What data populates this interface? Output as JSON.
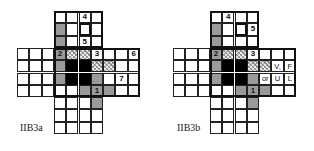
{
  "figures": [
    {
      "id": "a",
      "label": "IIB3a",
      "origin_x": 17,
      "label_pos": [
        20,
        122
      ],
      "cells": [
        {
          "r": 0,
          "c": 5,
          "text": "4"
        },
        {
          "r": 1,
          "c": 3,
          "fill": "grey"
        },
        {
          "r": 1,
          "c": 5,
          "fill": "bold"
        },
        {
          "r": 2,
          "c": 3,
          "fill": "grey"
        },
        {
          "r": 2,
          "c": 5,
          "text": "5"
        },
        {
          "r": 3,
          "c": 3,
          "fill": "grey",
          "text": "2"
        },
        {
          "r": 3,
          "c": 4,
          "fill": "hatch"
        },
        {
          "r": 3,
          "c": 5,
          "fill": "hatch"
        },
        {
          "r": 3,
          "c": 6,
          "text": "3"
        },
        {
          "r": 3,
          "c": 9,
          "text": "6"
        },
        {
          "r": 4,
          "c": 3,
          "fill": "grey"
        },
        {
          "r": 4,
          "c": 4,
          "fill": "black"
        },
        {
          "r": 4,
          "c": 5,
          "fill": "black"
        },
        {
          "r": 4,
          "c": 6,
          "fill": "hatch"
        },
        {
          "r": 4,
          "c": 7,
          "fill": "hatch"
        },
        {
          "r": 5,
          "c": 3,
          "fill": "grey"
        },
        {
          "r": 5,
          "c": 4,
          "fill": "black"
        },
        {
          "r": 5,
          "c": 5,
          "fill": "black"
        },
        {
          "r": 5,
          "c": 6,
          "fill": "grey"
        },
        {
          "r": 5,
          "c": 8,
          "text": "7"
        },
        {
          "r": 6,
          "c": 5,
          "fill": "grey"
        },
        {
          "r": 6,
          "c": 6,
          "fill": "grey",
          "text": "1"
        },
        {
          "r": 6,
          "c": 7,
          "fill": "grey"
        },
        {
          "r": 7,
          "c": 6,
          "fill": "grey"
        }
      ]
    },
    {
      "id": "b",
      "label": "IIB3b",
      "origin_x": 173,
      "label_pos": [
        177,
        122
      ],
      "cells": [
        {
          "r": 0,
          "c": 4,
          "text": "4"
        },
        {
          "r": 1,
          "c": 3,
          "fill": "grey"
        },
        {
          "r": 1,
          "c": 5,
          "fill": "bold"
        },
        {
          "r": 1,
          "c": 6,
          "text": "5"
        },
        {
          "r": 2,
          "c": 3,
          "fill": "grey"
        },
        {
          "r": 3,
          "c": 3,
          "fill": "grey",
          "text": "2"
        },
        {
          "r": 3,
          "c": 4,
          "fill": "hatch"
        },
        {
          "r": 3,
          "c": 5,
          "fill": "hatch"
        },
        {
          "r": 3,
          "c": 6,
          "text": "3"
        },
        {
          "r": 4,
          "c": 3,
          "fill": "grey"
        },
        {
          "r": 4,
          "c": 4,
          "fill": "black"
        },
        {
          "r": 4,
          "c": 5,
          "fill": "black"
        },
        {
          "r": 4,
          "c": 6,
          "fill": "hatch"
        },
        {
          "r": 4,
          "c": 7,
          "fill": "hatch"
        },
        {
          "r": 4,
          "c": 8,
          "text": "V,",
          "light": true
        },
        {
          "r": 4,
          "c": 9,
          "text": "F",
          "light": true
        },
        {
          "r": 5,
          "c": 3,
          "fill": "grey"
        },
        {
          "r": 5,
          "c": 4,
          "fill": "black"
        },
        {
          "r": 5,
          "c": 5,
          "fill": "black"
        },
        {
          "r": 5,
          "c": 6,
          "fill": "grey"
        },
        {
          "r": 5,
          "c": 7,
          "text": "or",
          "light": true
        },
        {
          "r": 5,
          "c": 8,
          "text": "U",
          "light": true
        },
        {
          "r": 5,
          "c": 9,
          "text": "L",
          "light": true
        },
        {
          "r": 6,
          "c": 5,
          "fill": "grey"
        },
        {
          "r": 6,
          "c": 6,
          "fill": "grey",
          "text": "1"
        },
        {
          "r": 6,
          "c": 7,
          "fill": "grey"
        },
        {
          "r": 7,
          "c": 6,
          "fill": "grey"
        }
      ]
    }
  ],
  "grid": {
    "rows": 10,
    "cols": 10,
    "cell": 12.3,
    "wide_rows": [
      3,
      4,
      5,
      6
    ],
    "narrow_cols": [
      3,
      4,
      5,
      6
    ]
  }
}
